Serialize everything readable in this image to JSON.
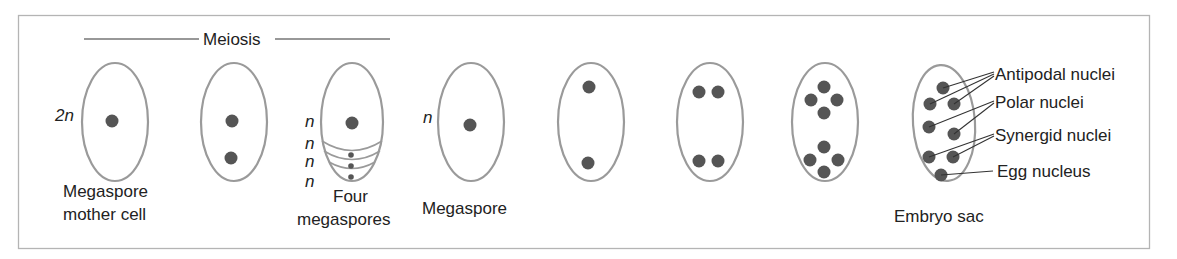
{
  "figure": {
    "stage_header": "Meiosis",
    "colors": {
      "frame": "#b4b4b4",
      "cell_outline": "#9a9a9a",
      "nucleus": "#555555",
      "text": "#222222"
    },
    "stages": [
      {
        "id": "megaspore-mother-cell",
        "label_lines": [
          "Megaspore",
          "mother cell"
        ],
        "ploidy": "2n",
        "nuclei_count": 1
      },
      {
        "id": "meiosis-i",
        "label_lines": [],
        "ploidy": "",
        "nuclei_count": 2
      },
      {
        "id": "four-megaspores",
        "label_lines": [
          "Four",
          "megaspores"
        ],
        "ploidy": "n",
        "ploidy_repeats": 4,
        "nuclei_count": 4
      },
      {
        "id": "megaspore",
        "label_lines": [
          "Megaspore"
        ],
        "ploidy": "n",
        "nuclei_count": 1
      },
      {
        "id": "two-nucleate",
        "label_lines": [],
        "ploidy": "",
        "nuclei_count": 2
      },
      {
        "id": "four-nucleate",
        "label_lines": [],
        "ploidy": "",
        "nuclei_count": 4
      },
      {
        "id": "eight-nucleate",
        "label_lines": [],
        "ploidy": "",
        "nuclei_count": 8
      },
      {
        "id": "embryo-sac",
        "label_lines": [
          "Embryo sac"
        ],
        "ploidy": "",
        "nuclei_count": 8
      }
    ],
    "labels": {
      "two_n": "2n",
      "n": "n",
      "megaspore_mother_cell_1": "Megaspore",
      "megaspore_mother_cell_2": "mother cell",
      "four_megaspores_1": "Four",
      "four_megaspores_2": "megaspores",
      "megaspore": "Megaspore",
      "embryo_sac": "Embryo sac"
    },
    "embryo_sac_parts": {
      "antipodal": "Antipodal nuclei",
      "polar": "Polar nuclei",
      "synergid": "Synergid nuclei",
      "egg": "Egg nucleus"
    }
  }
}
